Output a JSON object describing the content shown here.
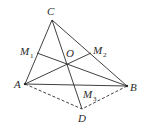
{
  "figure": {
    "points": {
      "A": {
        "label": "A",
        "x": 25,
        "y": 84
      },
      "B": {
        "label": "B",
        "x": 127,
        "y": 86
      },
      "C": {
        "label": "C",
        "x": 52,
        "y": 20
      },
      "D": {
        "label": "D",
        "x": 82,
        "y": 109
      },
      "O": {
        "label": "O",
        "x": 67,
        "y": 64
      },
      "M1": {
        "label": "M",
        "sub": "1",
        "x": 37,
        "y": 53
      },
      "M2": {
        "label": "M",
        "sub": "2",
        "x": 91,
        "y": 53
      },
      "M3": {
        "label": "M",
        "sub": "3",
        "x": 76,
        "y": 85
      }
    },
    "solid_segments": [
      "AB",
      "BC",
      "CA",
      "AM2",
      "BM1",
      "CD"
    ],
    "dashed_segments": [
      "AD",
      "BD"
    ]
  }
}
